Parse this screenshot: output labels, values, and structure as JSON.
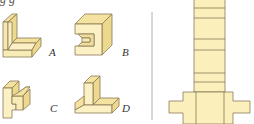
{
  "figure": {
    "top_caption_fragment": "g      g",
    "options": [
      {
        "label": "A"
      },
      {
        "label": "B"
      },
      {
        "label": "C"
      },
      {
        "label": "D"
      }
    ],
    "colors": {
      "face_light": "#fbf1c4",
      "face_mid": "#f6e6a8",
      "face_dark": "#ecd88e",
      "edge": "#8a7a55",
      "divider": "#9a9a9a",
      "net_fill": "#fbefbc",
      "net_line": "#7a6a45"
    },
    "net": {
      "strip_fold_lines_y": [
        8,
        18,
        39,
        50,
        73,
        82,
        92
      ],
      "description": "unfolded net of a solid"
    }
  }
}
